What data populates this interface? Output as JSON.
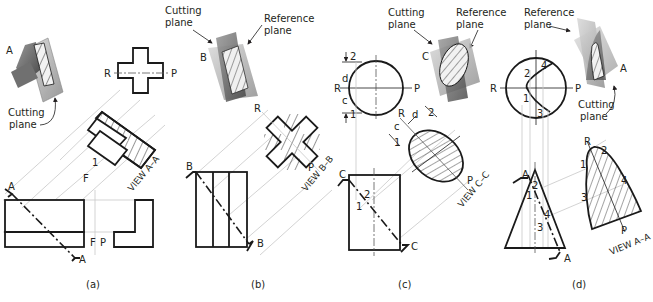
{
  "figure": {
    "panels": [
      {
        "caption": "(a)",
        "labels": {
          "cutting_plane": "Cutting plane",
          "section_letter": "A",
          "view": "VIEW A–A",
          "fold_f": "F",
          "fold_p": "P",
          "point_1": "1"
        }
      },
      {
        "caption": "(b)",
        "labels": {
          "cutting_plane": "Cutting plane",
          "reference_plane": "Reference plane",
          "section_letter": "B",
          "view": "VIEW B–B",
          "r": "R",
          "p": "P"
        }
      },
      {
        "caption": "(c)",
        "labels": {
          "cutting_plane": "Cutting plane",
          "reference_plane": "Reference plane",
          "section_letter": "C",
          "view": "VIEW C–C",
          "r": "R",
          "p": "P",
          "c": "c",
          "d": "d",
          "point_1": "1",
          "point_2": "2"
        }
      },
      {
        "caption": "(d)",
        "labels": {
          "cutting_plane": "Cutting plane",
          "reference_plane": "Reference plane",
          "section_letter": "A",
          "view": "VIEW A–A",
          "r": "R",
          "p": "P",
          "point_1": "1",
          "point_2": "2",
          "point_3": "3",
          "point_4": "4"
        }
      }
    ]
  }
}
